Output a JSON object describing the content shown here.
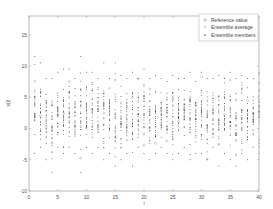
{
  "chart_data": {
    "type": "scatter",
    "title": "",
    "xlabel": "i",
    "ylabel": "x(i)",
    "xlim": [
      0,
      40
    ],
    "ylim": [
      -10,
      18
    ],
    "xticks": [
      0,
      5,
      10,
      15,
      20,
      25,
      30,
      35,
      40
    ],
    "yticks": [
      -10,
      -5,
      0,
      5,
      10,
      15
    ],
    "grid": false,
    "legend_position": "upper right",
    "legend": [
      {
        "label": "Reference value",
        "marker": "o",
        "color": "#888888"
      },
      {
        "label": "Ensemble average",
        "marker": "*",
        "color": "#888888"
      },
      {
        "label": "Ensemble members",
        "marker": ".",
        "color": "#222222"
      }
    ],
    "series": [
      {
        "name": "Ensemble members",
        "description": "vertical columns of points at each integer i from 1 to 40, spread roughly from -7 to 12 with densest concentration between -3 and 8"
      },
      {
        "name": "Ensemble average",
        "description": "one point per i, near column centers (~2 to 4)"
      },
      {
        "name": "Reference value",
        "description": "one point per i, scattered roughly -8 to 12"
      }
    ],
    "columns": [
      {
        "i": 1,
        "min": -4,
        "max": 11.5
      },
      {
        "i": 2,
        "min": -3,
        "max": 10.5
      },
      {
        "i": 3,
        "min": -5,
        "max": 8
      },
      {
        "i": 4,
        "min": -7,
        "max": 8
      },
      {
        "i": 5,
        "min": -3,
        "max": 9
      },
      {
        "i": 6,
        "min": -4,
        "max": 9.5
      },
      {
        "i": 7,
        "min": -3,
        "max": 9.5
      },
      {
        "i": 8,
        "min": -4,
        "max": 8
      },
      {
        "i": 9,
        "min": -7,
        "max": 11.5
      },
      {
        "i": 10,
        "min": -3,
        "max": 9
      },
      {
        "i": 11,
        "min": -4,
        "max": 9
      },
      {
        "i": 12,
        "min": -3,
        "max": 8
      },
      {
        "i": 13,
        "min": -5,
        "max": 10.5
      },
      {
        "i": 14,
        "min": -4,
        "max": 8
      },
      {
        "i": 15,
        "min": -6,
        "max": 10.5
      },
      {
        "i": 16,
        "min": -5,
        "max": 8.5
      },
      {
        "i": 17,
        "min": -4,
        "max": 8
      },
      {
        "i": 18,
        "min": -6,
        "max": 9
      },
      {
        "i": 19,
        "min": -3,
        "max": 8
      },
      {
        "i": 20,
        "min": -4,
        "max": 9.5
      },
      {
        "i": 21,
        "min": -5,
        "max": 8
      },
      {
        "i": 22,
        "min": -4,
        "max": 8.5
      },
      {
        "i": 23,
        "min": -3,
        "max": 8
      },
      {
        "i": 24,
        "min": -4,
        "max": 7.5
      },
      {
        "i": 25,
        "min": -5,
        "max": 8.5
      },
      {
        "i": 26,
        "min": -4,
        "max": 8
      },
      {
        "i": 27,
        "min": -3,
        "max": 8
      },
      {
        "i": 28,
        "min": -5,
        "max": 9
      },
      {
        "i": 29,
        "min": -4,
        "max": 7.5
      },
      {
        "i": 30,
        "min": -4,
        "max": 9
      },
      {
        "i": 31,
        "min": -5,
        "max": 8
      },
      {
        "i": 32,
        "min": -3,
        "max": 8
      },
      {
        "i": 33,
        "min": -6,
        "max": 8.5
      },
      {
        "i": 34,
        "min": -4,
        "max": 8
      },
      {
        "i": 35,
        "min": -5,
        "max": 9
      },
      {
        "i": 36,
        "min": -6,
        "max": 8
      },
      {
        "i": 37,
        "min": -4,
        "max": 8.5
      },
      {
        "i": 38,
        "min": -5,
        "max": 8
      },
      {
        "i": 39,
        "min": -3,
        "max": 8
      },
      {
        "i": 40,
        "min": -4,
        "max": 9
      }
    ]
  },
  "axes": {
    "xlabel": "i",
    "ylabel": "x(i)"
  },
  "legend": {
    "items": [
      "Reference value",
      "Ensemble average",
      "Ensemble members"
    ]
  },
  "colors": {
    "axis": "#aaaaaa",
    "member": "#222222",
    "marker": "#888888",
    "label": "#555555"
  }
}
